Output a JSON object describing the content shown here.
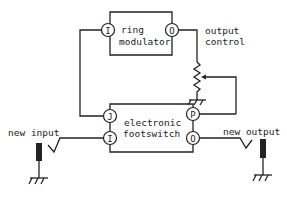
{
  "diagram": {
    "type": "circuit-schematic",
    "blocks": {
      "ring_modulator": {
        "line1": "ring",
        "line2": "modulator",
        "pin_in": "I",
        "pin_out": "O"
      },
      "footswitch": {
        "line1": "electronic",
        "line2": "footswitch",
        "pin_j": "J",
        "pin_i": "I",
        "pin_p": "P",
        "pin_o": "O"
      },
      "output_control": {
        "line1": "output",
        "line2": "control"
      }
    },
    "labels": {
      "new_input": "new input",
      "new_output": "new output"
    },
    "connections": [
      {
        "from": "footswitch.J",
        "to": "ring_modulator.I"
      },
      {
        "from": "ring_modulator.O",
        "to": "output_control.top"
      },
      {
        "from": "output_control.wiper",
        "to": "footswitch.P"
      },
      {
        "from": "new_input_jack",
        "to": "footswitch.I"
      },
      {
        "from": "footswitch.O",
        "to": "new_output_jack"
      }
    ],
    "colors": {
      "line": "#222222",
      "background": "#ffffff"
    }
  }
}
